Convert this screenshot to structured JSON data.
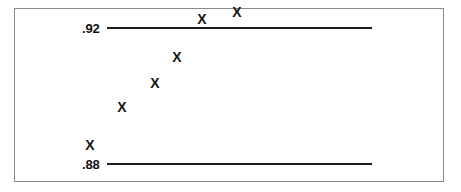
{
  "chart_data": {
    "type": "scatter",
    "title": "",
    "subtitle": "",
    "xlabel": "",
    "ylabel": "",
    "grid": false,
    "legend": null,
    "marker_symbol": "X",
    "axis_tick_labels": [
      ".88",
      ".92"
    ],
    "ylim": [
      0.88,
      0.92
    ],
    "reference_lines": [
      {
        "label": ".92",
        "value": 0.92
      },
      {
        "label": ".88",
        "value": 0.88
      }
    ],
    "x": [
      1,
      2,
      3,
      4,
      5,
      6
    ],
    "values": [
      0.8853,
      0.8965,
      0.9035,
      0.9112,
      0.9225,
      0.9243
    ],
    "points": [
      {
        "label": "X",
        "x": 1,
        "y": 0.8853
      },
      {
        "label": "X",
        "x": 2,
        "y": 0.8965
      },
      {
        "label": "X",
        "x": 3,
        "y": 0.9035
      },
      {
        "label": "X",
        "x": 4,
        "y": 0.9112
      },
      {
        "label": "X",
        "x": 5,
        "y": 0.9225
      },
      {
        "label": "X",
        "x": 6,
        "y": 0.9243
      }
    ]
  },
  "layout": {
    "line_start_px": 107,
    "line_end_px": 372,
    "top_line_y_px": 27,
    "bottom_line_y_px": 163,
    "point_x_px": [
      90,
      122,
      155,
      177,
      202,
      237
    ],
    "point_y_px": [
      145,
      124,
      100,
      74,
      47,
      41
    ]
  },
  "colors": {
    "line": "#1a1a1a",
    "marker": "#151515",
    "frame": "#8a8a8a",
    "background": "#ffffff",
    "label": "#111111"
  }
}
